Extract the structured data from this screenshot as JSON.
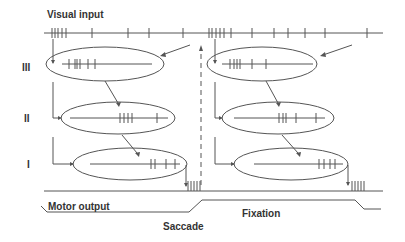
{
  "labels": {
    "visual_input": "Visual input",
    "motor_output": "Motor output",
    "saccade": "Saccade",
    "fixation": "Fixation",
    "layer_3": "III",
    "layer_2": "II",
    "layer_1": "I"
  },
  "colors": {
    "stroke": "#555555",
    "text": "#333333",
    "background": "#ffffff"
  },
  "visual_input_spikes_x": [
    52,
    55,
    58,
    62,
    66,
    92,
    128,
    149,
    183,
    209,
    212,
    216,
    220,
    224,
    231,
    252,
    274,
    288,
    305,
    325,
    367
  ],
  "panels": [
    {
      "name": "left",
      "layer_3_spikes_x": [
        69,
        75,
        77,
        80,
        88,
        95
      ],
      "layer_2_spikes_x": [
        120,
        124,
        128,
        132,
        157
      ],
      "layer_1_spikes_x": [
        151,
        155,
        166,
        175
      ],
      "output_burst_x": [
        188,
        191,
        194,
        197,
        200
      ]
    },
    {
      "name": "right",
      "layer_3_spikes_x": [
        230,
        234,
        237,
        240,
        252,
        266
      ],
      "layer_2_spikes_x": [
        279,
        283,
        286,
        296,
        316
      ],
      "layer_1_spikes_x": [
        319,
        324,
        330,
        335
      ],
      "output_burst_x": [
        352,
        355,
        358,
        361,
        364
      ]
    }
  ]
}
